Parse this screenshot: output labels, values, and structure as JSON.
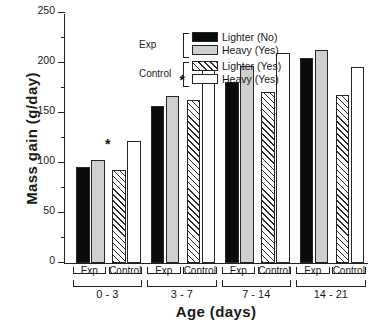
{
  "chart_data": {
    "type": "bar",
    "title": "",
    "xlabel": "Age  (days)",
    "ylabel": "Mass gain (g/day)",
    "ylim": [
      0,
      250
    ],
    "yticks": [
      0,
      50,
      100,
      150,
      200,
      250
    ],
    "ytick_labels": [
      "0",
      "50",
      "100",
      "150",
      "200",
      "250"
    ],
    "yminor_ticks": [
      25,
      75,
      125,
      175,
      225
    ],
    "grid": false,
    "legend_position": "top-left",
    "categories": [
      "0 - 3",
      "3 - 7",
      "7 - 14",
      "14 - 21"
    ],
    "subgroups": [
      "Exp",
      "Control"
    ],
    "series": [
      {
        "name": "Lighter (No)",
        "group": "Exp",
        "fill": "black",
        "values": [
          96,
          157,
          181,
          205
        ]
      },
      {
        "name": "Heavy (Yes)",
        "group": "Exp",
        "fill": "gray",
        "values": [
          103,
          167,
          197,
          213
        ]
      },
      {
        "name": "Lighter (Yes)",
        "group": "Control",
        "fill": "hatch",
        "values": [
          93,
          163,
          171,
          168
        ]
      },
      {
        "name": "Heavy (Yes)",
        "group": "Control",
        "fill": "white",
        "values": [
          122,
          200,
          210,
          196
        ]
      }
    ],
    "annotations": [
      {
        "text": "*",
        "category": "0 - 3",
        "note": "significance marker"
      },
      {
        "text": "*",
        "category": "3 - 7",
        "note": "significance marker"
      }
    ]
  },
  "legend": {
    "groups": [
      {
        "name": "Exp",
        "entries": [
          {
            "label": "Lighter (No)",
            "fill": "black"
          },
          {
            "label": "Heavy (Yes)",
            "fill": "gray"
          }
        ]
      },
      {
        "name": "Control",
        "entries": [
          {
            "label": "Lighter (Yes)",
            "fill": "hatch"
          },
          {
            "label": "Heavy (Yes)",
            "fill": "white"
          }
        ]
      }
    ]
  },
  "colors": {
    "axis": "#222222",
    "black_bar": "#0b0b0b",
    "gray_bar": "#cfcfcf",
    "white_bar": "#ffffff",
    "hatch_line": "#2b2b2b",
    "background": "#ffffff"
  }
}
